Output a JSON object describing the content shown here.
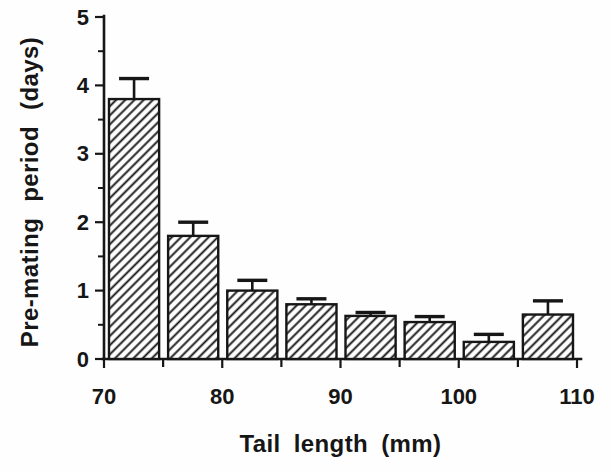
{
  "figure": {
    "background_color": "#fefefe"
  },
  "chart_data": {
    "type": "bar",
    "title": "",
    "xlabel": "Tail length (mm)",
    "ylabel": "Pre-mating period (days)",
    "categories": [
      "70-75",
      "75-80",
      "80-85",
      "85-90",
      "90-95",
      "95-100",
      "100-105",
      "105-110"
    ],
    "bin_edges_mm": [
      70,
      75,
      80,
      85,
      90,
      95,
      100,
      105,
      110
    ],
    "values": [
      3.8,
      1.8,
      1.0,
      0.8,
      0.63,
      0.54,
      0.25,
      0.65
    ],
    "upper_errors": [
      0.3,
      0.2,
      0.15,
      0.08,
      0.05,
      0.08,
      0.11,
      0.2
    ],
    "xlim": [
      70,
      110
    ],
    "ylim": [
      0,
      5
    ],
    "x_major_ticks": [
      70,
      80,
      90,
      100,
      110
    ],
    "x_minor_ticks": [
      75,
      85,
      95,
      105
    ],
    "y_major_ticks": [
      0,
      1,
      2,
      3,
      4,
      5
    ],
    "y_minor_ticks": [
      0.5,
      1.5,
      2.5,
      3.5,
      4.5
    ],
    "grid": false,
    "legend": "none",
    "bar_fill_style": "diagonal-hatch",
    "error_bar_style": "upper-cap",
    "ink_color": "#161616",
    "background_color": "#fefefe"
  }
}
